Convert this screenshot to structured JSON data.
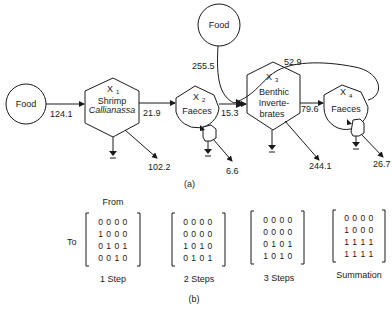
{
  "part_a": {
    "caption": "(a)",
    "nodes": {
      "food_left": {
        "label": "Food"
      },
      "food_top": {
        "label": "Food"
      },
      "x1": {
        "var": "X",
        "sub": "1",
        "line1": "Shrimp",
        "line2": "Callianassa"
      },
      "x2": {
        "var": "X",
        "sub": "2",
        "line1": "Faeces"
      },
      "x3": {
        "var": "X",
        "sub": "3",
        "line1": "Benthic",
        "line2": "Inverte-",
        "line3": "brates"
      },
      "x4": {
        "var": "X",
        "sub": "4",
        "line1": "Faeces"
      }
    },
    "flows": {
      "food_to_x1": "124.1",
      "x1_to_x2": "21.9",
      "x1_out": "102.2",
      "food_to_x3": "255.5",
      "x2_to_x3": "15.3",
      "x2_out": "6.6",
      "x3_to_x4": "79.6",
      "x4_to_x3": "52.9",
      "x3_out": "244.1",
      "x4_out": "26.7"
    }
  },
  "part_b": {
    "caption": "(b)",
    "from_label": "From",
    "to_label": "To",
    "matrices": [
      {
        "label": "1 Step",
        "rows": [
          "0 0 0 0",
          "1 0 0 0",
          "0 1 0 1",
          "0 0 1 0"
        ]
      },
      {
        "label": "2 Steps",
        "rows": [
          "0 0 0 0",
          "0 0 0 0",
          "1 0 1 0",
          "0 1 0 1"
        ]
      },
      {
        "label": "3 Steps",
        "rows": [
          "0 0 0 0",
          "0 0 0 0",
          "0 1 0 1",
          "1 0 1 0"
        ]
      },
      {
        "label": "Summation",
        "rows": [
          "0 0 0 0",
          "1 0 0 0",
          "1 1 1 1",
          "1 1 1 1"
        ]
      }
    ]
  }
}
